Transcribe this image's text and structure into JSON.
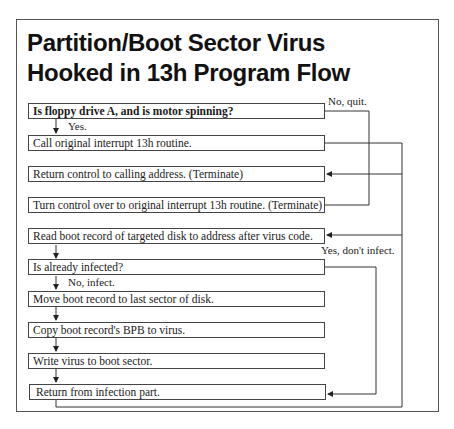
{
  "title": {
    "line1": "Partition/Boot Sector Virus",
    "line2": "Hooked in 13h Program Flow"
  },
  "steps": [
    {
      "id": "check-floppy",
      "label": "Is floppy drive A, and is motor spinning?",
      "bold": true
    },
    {
      "id": "call-original",
      "label": "Call original interrupt 13h routine."
    },
    {
      "id": "return-control",
      "label": "Return control to calling address. (Terminate)"
    },
    {
      "id": "turn-control",
      "label": "Turn control over to original interrupt 13h routine. (Terminate)"
    },
    {
      "id": "read-boot",
      "label": "Read boot record of targeted disk to address after virus code."
    },
    {
      "id": "already-infected",
      "label": "Is already infected?"
    },
    {
      "id": "move-boot",
      "label": "Move boot record to last sector of disk."
    },
    {
      "id": "copy-bpb",
      "label": "Copy boot record's BPB to virus."
    },
    {
      "id": "write-virus",
      "label": "Write virus to boot sector."
    },
    {
      "id": "return-infection",
      "label": "Return from infection part."
    }
  ],
  "branch_labels": {
    "no_quit": "No, quit.",
    "yes": "Yes.",
    "yes_dont_infect": "Yes, don't infect.",
    "no_infect": "No, infect."
  },
  "colors": {
    "line": "#333333",
    "frame": "#555555",
    "text": "#1a1a1a"
  }
}
